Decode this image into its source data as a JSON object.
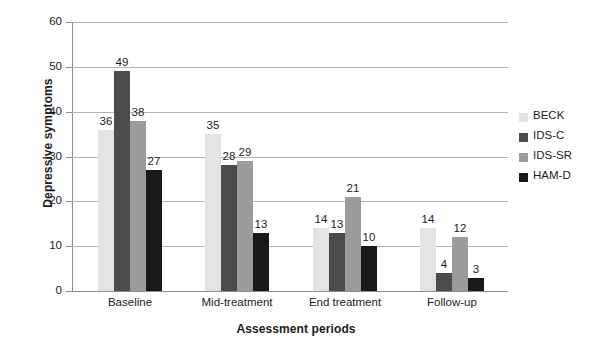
{
  "chart_data": {
    "type": "bar",
    "title": "",
    "xlabel": "Assessment periods",
    "ylabel": "Depressive symptoms",
    "categories": [
      "Baseline",
      "Mid-treatment",
      "End treatment",
      "Follow-up"
    ],
    "series": [
      {
        "name": "BECK",
        "color": "#e3e3e3",
        "values": [
          36,
          35,
          14,
          14
        ]
      },
      {
        "name": "IDS-C",
        "color": "#4b4b4b",
        "values": [
          49,
          28,
          13,
          4
        ]
      },
      {
        "name": "IDS-SR",
        "color": "#9b9b9b",
        "values": [
          38,
          29,
          21,
          12
        ]
      },
      {
        "name": "HAM-D",
        "color": "#191919",
        "values": [
          27,
          13,
          10,
          3
        ]
      }
    ],
    "ylim": [
      0,
      60
    ],
    "yticks": [
      0,
      10,
      20,
      30,
      40,
      50,
      60
    ],
    "ytick_labels": [
      "0",
      "10",
      "20",
      "30",
      "40",
      "50",
      "60"
    ],
    "grid": true,
    "grid_color": "#b4b4b4",
    "axis_color": "#8e8e8e",
    "legend_position": "right",
    "data_labels": true,
    "background": "#ffffff"
  }
}
